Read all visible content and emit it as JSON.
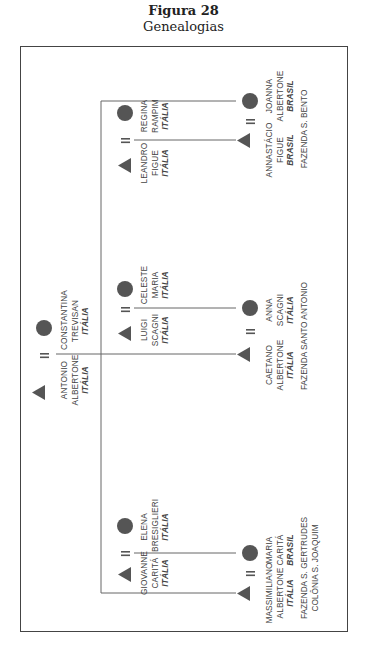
{
  "figure": {
    "number": "Figura 28",
    "title": "Genealogias"
  },
  "colors": {
    "symbol": "#555555",
    "line": "#666666",
    "frame": "#444444",
    "text": "#444444"
  },
  "legend_symbols": {
    "male": "triangle",
    "female": "circle",
    "marriage": "="
  },
  "root_couple": {
    "husband": {
      "first": "ANTONIO",
      "last": "ALBERTONE",
      "country": "ITÁLIA"
    },
    "wife": {
      "first": "CONSTANTINA",
      "last": "TREVISAN",
      "country": "ITÁLIA"
    }
  },
  "branches": [
    {
      "parents": {
        "husband": {
          "first": "LEANDRO",
          "last": "FIGUE",
          "country": "ITÁLIA"
        },
        "wife": {
          "first": "REGINA",
          "last": "RAMPIM",
          "country": "ITÁLIA"
        }
      },
      "couple": {
        "husband": {
          "first": "ANNASTÁCIO",
          "last": "FIGUE",
          "country": "BRASIL"
        },
        "wife": {
          "first": "JOANNA",
          "last": "ALBERTONE",
          "country": "BRASIL"
        }
      },
      "places": [
        "FAZENDA S. BENTO"
      ]
    },
    {
      "parents": {
        "husband": {
          "first": "LUIGI",
          "last": "SCAGNI",
          "country": "ITÁLIA"
        },
        "wife": {
          "first": "CELESTE",
          "last": "MARIA",
          "country": "ITÁLIA"
        }
      },
      "couple": {
        "husband": {
          "first": "CAETANO",
          "last": "ALBERTONE",
          "country": "ITÁLIA"
        },
        "wife": {
          "first": "ANNA",
          "last": "SCAGNI",
          "country": "ITÁLIA"
        }
      },
      "places": [
        "FAZENDA SANTO ANTONIO"
      ]
    },
    {
      "parents": {
        "husband": {
          "first": "GIOVANNE",
          "last": "CARITÁ",
          "country": "ITÁLIA"
        },
        "wife": {
          "first": "ELENA",
          "last": "BRESIGLIERI",
          "country": "ITÁLIA"
        }
      },
      "couple": {
        "husband": {
          "first": "MASSIMILIANO",
          "last": "ALBERTONE",
          "country": "ITÁLIA"
        },
        "wife": {
          "first": "MARIA",
          "last": "CARITÁ",
          "country": "BRASIL"
        }
      },
      "places": [
        "FAZENDA S. GERTRUDES",
        "COLÔNIA S. JOAQUIM"
      ]
    }
  ]
}
